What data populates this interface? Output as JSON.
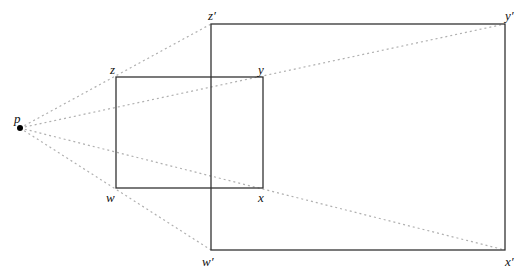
{
  "diagram": {
    "center": {
      "label": "p",
      "x": 20,
      "y": 128
    },
    "small_rect": {
      "corners": [
        {
          "label": "z",
          "x": 116,
          "y": 77
        },
        {
          "label": "y",
          "x": 263,
          "y": 77
        },
        {
          "label": "x",
          "x": 263,
          "y": 188
        },
        {
          "label": "w",
          "x": 116,
          "y": 188
        }
      ]
    },
    "large_rect": {
      "corners": [
        {
          "label": "z′",
          "x": 211,
          "y": 24
        },
        {
          "label": "y′",
          "x": 505,
          "y": 24
        },
        {
          "label": "x′",
          "x": 505,
          "y": 250
        },
        {
          "label": "w′",
          "x": 211,
          "y": 250
        }
      ]
    },
    "colors": {
      "rect_stroke": "#333333",
      "ray_stroke": "#b0b0b0",
      "point": "#000000"
    }
  }
}
